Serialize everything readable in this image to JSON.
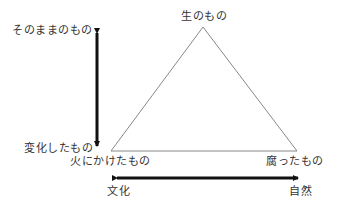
{
  "diagram": {
    "vertices": {
      "top": "生のもの",
      "bottom_left": "火にかけたもの",
      "bottom_right": "腐ったもの"
    },
    "vertical_axis": {
      "top_label": "そのままのもの",
      "bottom_label": "変化したもの"
    },
    "horizontal_axis": {
      "left_label": "文化",
      "right_label": "自然"
    },
    "colors": {
      "triangle": "#888888",
      "arrows": "#111111",
      "text": "#333333"
    }
  }
}
